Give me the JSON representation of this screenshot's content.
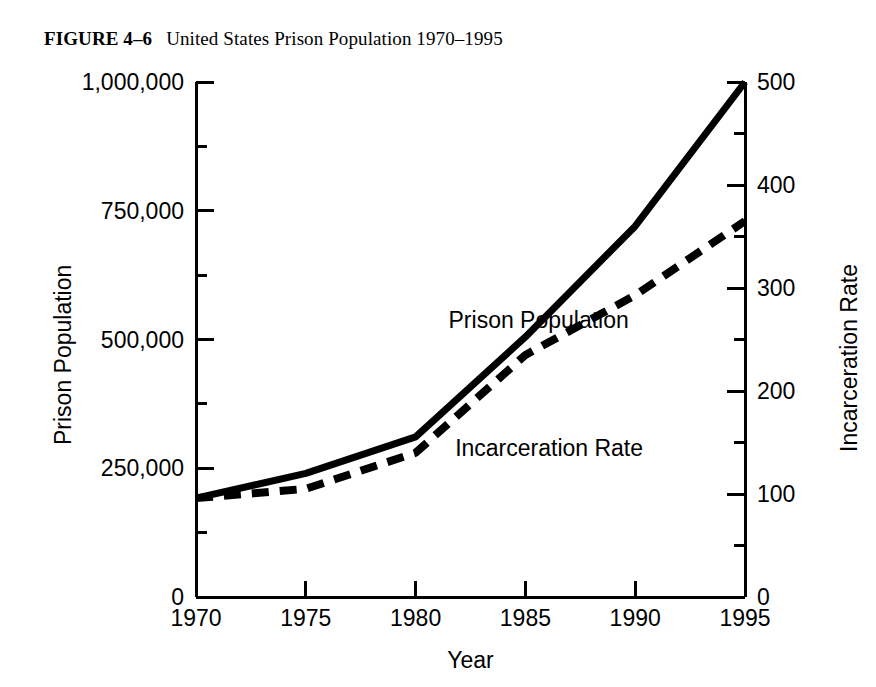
{
  "figure": {
    "label": "FIGURE 4–6",
    "title": "United States Prison Population 1970–1995"
  },
  "chart_data": {
    "type": "line",
    "title": "United States Prison Population 1970–1995",
    "xlabel": "Year",
    "ylabel": "Prison Population",
    "y2label": "Incarceration Rate",
    "grid": false,
    "legend_position": "inline-annotation",
    "x": [
      1970,
      1975,
      1980,
      1985,
      1990,
      1995
    ],
    "xlim": [
      1970,
      1995
    ],
    "xticks": [
      1970,
      1975,
      1980,
      1985,
      1990,
      1995
    ],
    "xtick_labels": [
      "1970",
      "1975",
      "1980",
      "1985",
      "1990",
      "1995"
    ],
    "ylim": [
      0,
      1000000
    ],
    "yticks": [
      0,
      250000,
      500000,
      750000,
      1000000
    ],
    "ytick_labels": [
      "0",
      "250,000",
      "500,000",
      "750,000",
      "1,000,000"
    ],
    "y_minor_ticks": [
      125000,
      375000,
      625000,
      875000
    ],
    "y2lim": [
      0,
      500
    ],
    "y2ticks": [
      0,
      100,
      200,
      300,
      400,
      500
    ],
    "y2tick_labels": [
      "0",
      "100",
      "200",
      "300",
      "400",
      "500"
    ],
    "y2_minor_ticks": [
      50,
      150,
      250,
      350,
      450
    ],
    "series": [
      {
        "name": "Prison Population",
        "axis": "left",
        "style": "solid",
        "color": "#000000",
        "values": [
          192000,
          240000,
          311000,
          505000,
          720000,
          1000000
        ]
      },
      {
        "name": "Incarceration Rate",
        "axis": "right",
        "style": "dashed",
        "color": "#000000",
        "values": [
          96,
          105,
          140,
          235,
          293,
          365
        ]
      }
    ],
    "annotations": [
      {
        "text": "Prison Population",
        "x": 1981.5,
        "y_value": 560000,
        "axis": "left"
      },
      {
        "text": "Incarceration Rate",
        "x": 1981.8,
        "y_value": 155,
        "axis": "right"
      }
    ]
  }
}
